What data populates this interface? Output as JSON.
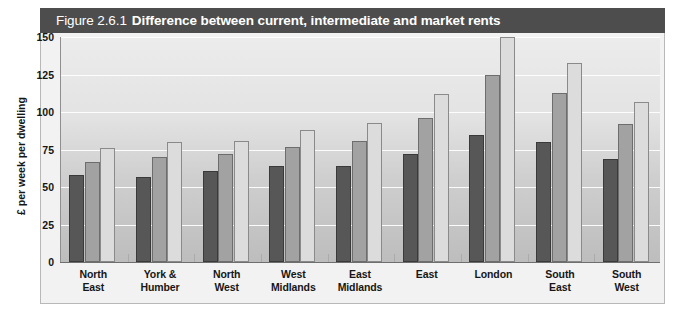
{
  "figure": {
    "number": "Figure 2.6.1",
    "title": "Difference between current, intermediate and market rents",
    "subtitle": "Figures for housing association stock and rents in 2007/08"
  },
  "colors": {
    "header_band": "#4d4d4d",
    "current_rents": "#575757",
    "intermediate_rents": "#a2a2a2",
    "market_rents": "#dcdcdc",
    "panel_background": "#f2f2f2",
    "gridline": "#ffffff"
  },
  "chart_data": {
    "type": "bar",
    "title": "Difference between current, intermediate and market rents",
    "subtitle": "Figures for housing association stock and rents in 2007/08",
    "xlabel": "",
    "ylabel": "£ per week per dwelling",
    "ylim": [
      0,
      150
    ],
    "yticks": [
      0,
      25,
      50,
      75,
      100,
      125,
      150
    ],
    "ytick_labels": [
      "0",
      "25",
      "50",
      "75",
      "100",
      "125",
      "150"
    ],
    "grid": true,
    "legend_position": "top-left",
    "categories": [
      "North East",
      "York & Humber",
      "North West",
      "West Midlands",
      "East Midlands",
      "East",
      "London",
      "South East",
      "South West"
    ],
    "category_lines": [
      [
        "North",
        "East"
      ],
      [
        "York &",
        "Humber"
      ],
      [
        "North",
        "West"
      ],
      [
        "West",
        "Midlands"
      ],
      [
        "East",
        "Midlands"
      ],
      [
        "East",
        ""
      ],
      [
        "London",
        ""
      ],
      [
        "South",
        "East"
      ],
      [
        "South",
        "West"
      ]
    ],
    "series": [
      {
        "name": "Current rents",
        "color": "#575757",
        "values": [
          58,
          57,
          61,
          64,
          64,
          72,
          85,
          80,
          69
        ]
      },
      {
        "name": "Intermediate rents",
        "color": "#a2a2a2",
        "values": [
          67,
          70,
          72,
          77,
          81,
          96,
          125,
          113,
          92
        ]
      },
      {
        "name": "Market rents",
        "color": "#dcdcdc",
        "values": [
          76,
          80,
          81,
          88,
          93,
          112,
          150,
          133,
          107
        ]
      }
    ]
  }
}
